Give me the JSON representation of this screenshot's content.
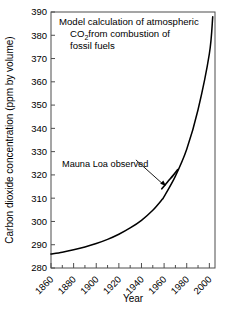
{
  "chart_data": {
    "type": "line",
    "title_lines": [
      "Model calculation of atmospheric",
      "from combustion of",
      "fossil fuels"
    ],
    "title_line2_prefix": "CO",
    "title_line2_sub": "2",
    "xlabel": "Year",
    "ylabel": "Carbon dioxide concentration (ppm by volume)",
    "xlim": [
      1860,
      2005
    ],
    "ylim": [
      280,
      390
    ],
    "grid": false,
    "legend": "none",
    "x_ticks": [
      1860,
      1880,
      1900,
      1920,
      1940,
      1960,
      1980,
      2000
    ],
    "x_tick_labels": [
      "1860",
      "1880",
      "1900",
      "1920",
      "1940",
      "1960",
      "1980",
      "2000"
    ],
    "x_minor_step": 10,
    "y_ticks": [
      280,
      290,
      300,
      310,
      320,
      330,
      340,
      350,
      360,
      370,
      380,
      390
    ],
    "y_tick_labels": [
      "280",
      "290",
      "300",
      "310",
      "320",
      "330",
      "340",
      "350",
      "360",
      "370",
      "380",
      "390"
    ],
    "annotations": [
      {
        "text": "Mauna Loa observed",
        "x": 1905,
        "y": 326,
        "points_to_x": 1962,
        "points_to_y": 315
      }
    ],
    "series": [
      {
        "name": "Model calculation",
        "x": [
          1860,
          1870,
          1880,
          1890,
          1900,
          1910,
          1920,
          1930,
          1940,
          1950,
          1958,
          1960,
          1970,
          1980,
          1990,
          2000,
          2003
        ],
        "values": [
          286,
          286.8,
          287.8,
          289.0,
          290.5,
          292.3,
          294.5,
          297.2,
          300.5,
          304.8,
          309.3,
          310.7,
          319.5,
          331.0,
          348.0,
          372.0,
          388.0
        ]
      },
      {
        "name": "Mauna Loa observed",
        "x": [
          1958,
          1963,
          1968,
          1972
        ],
        "values": [
          314.0,
          317.0,
          319.8,
          322.3
        ]
      }
    ]
  }
}
